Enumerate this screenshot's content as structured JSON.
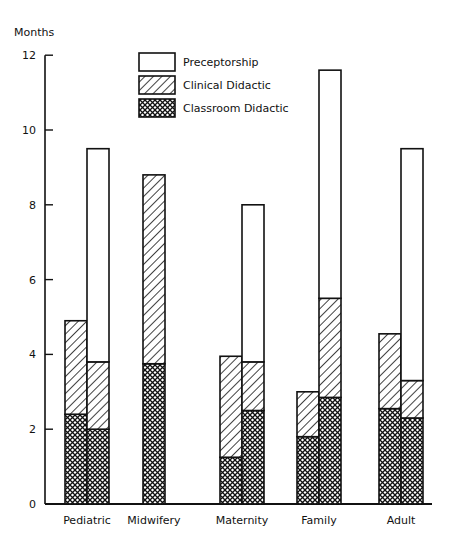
{
  "chart_data": {
    "type": "bar",
    "stacked": true,
    "title": "",
    "xlabel": "",
    "ylabel": "Months",
    "ylim": [
      0,
      12
    ],
    "yticks": [
      0,
      2,
      4,
      6,
      8,
      10,
      12
    ],
    "grid": false,
    "legend_position": "top-center (inside plot)",
    "categories": [
      "Pediatric",
      "Midwifery",
      "Maternity",
      "Family",
      "Adult"
    ],
    "legend": [
      {
        "name": "Preceptorship",
        "pattern": "blank"
      },
      {
        "name": "Clinical Didactic",
        "pattern": "diagonal"
      },
      {
        "name": "Classroom Didactic",
        "pattern": "crosshatch"
      }
    ],
    "bars": [
      {
        "category": "Pediatric",
        "bar": 1,
        "Classroom Didactic": 2.4,
        "Clinical Didactic": 2.5,
        "Preceptorship": 0.0,
        "total": 4.9
      },
      {
        "category": "Pediatric",
        "bar": 2,
        "Classroom Didactic": 2.0,
        "Clinical Didactic": 1.8,
        "Preceptorship": 5.7,
        "total": 9.5
      },
      {
        "category": "Midwifery",
        "bar": 1,
        "Classroom Didactic": 3.75,
        "Clinical Didactic": 5.05,
        "Preceptorship": 0.0,
        "total": 8.8
      },
      {
        "category": "Maternity",
        "bar": 1,
        "Classroom Didactic": 1.25,
        "Clinical Didactic": 2.7,
        "Preceptorship": 0.0,
        "total": 3.95
      },
      {
        "category": "Maternity",
        "bar": 2,
        "Classroom Didactic": 2.5,
        "Clinical Didactic": 1.3,
        "Preceptorship": 4.2,
        "total": 8.0
      },
      {
        "category": "Family",
        "bar": 1,
        "Classroom Didactic": 1.8,
        "Clinical Didactic": 1.2,
        "Preceptorship": 0.0,
        "total": 3.0
      },
      {
        "category": "Family",
        "bar": 2,
        "Classroom Didactic": 2.85,
        "Clinical Didactic": 2.65,
        "Preceptorship": 6.1,
        "total": 11.6
      },
      {
        "category": "Adult",
        "bar": 1,
        "Classroom Didactic": 2.55,
        "Clinical Didactic": 2.0,
        "Preceptorship": 0.0,
        "total": 4.55
      },
      {
        "category": "Adult",
        "bar": 2,
        "Classroom Didactic": 2.3,
        "Clinical Didactic": 1.0,
        "Preceptorship": 6.2,
        "total": 9.5
      }
    ]
  }
}
